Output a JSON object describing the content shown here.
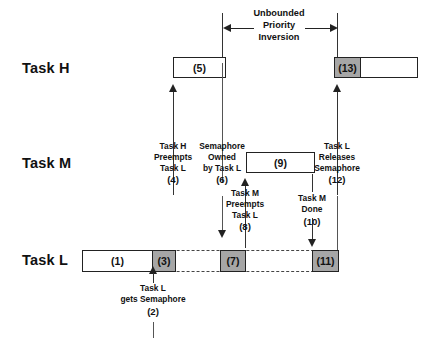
{
  "diagram": {
    "colors": {
      "busy_fill": "#a6a6a6",
      "idle_fill": "#ffffff",
      "stroke": "#222222"
    }
  },
  "span": {
    "line1": "Unbounded",
    "line2": "Priority",
    "line3": "Inversion"
  },
  "rows": [
    {
      "label": "Task H"
    },
    {
      "label": "Task M"
    },
    {
      "label": "Task L"
    }
  ],
  "segments": {
    "task_h_5": "(5)",
    "task_h_13_gray": "(13)",
    "task_m_9": "(9)",
    "task_l_1": "(1)",
    "task_l_3": "(3)",
    "task_l_7": "(7)",
    "task_l_11": "(11)"
  },
  "notes": [
    {
      "id": "n2",
      "lines": [
        "Task L",
        "gets Semaphore"
      ],
      "num": "(2)"
    },
    {
      "id": "n4",
      "lines": [
        "Task H",
        "Preempts",
        "Task L"
      ],
      "num": "(4)"
    },
    {
      "id": "n6",
      "lines": [
        "Semaphore",
        "Owned",
        "by Task L"
      ],
      "num": "(6)"
    },
    {
      "id": "n8",
      "lines": [
        "Task M",
        "Preempts",
        "Task L"
      ],
      "num": "(8)"
    },
    {
      "id": "n10",
      "lines": [
        "Task M",
        "Done"
      ],
      "num": "(10)"
    },
    {
      "id": "n12",
      "lines": [
        "Task L",
        "Releases",
        "Semaphore"
      ],
      "num": "(12)"
    }
  ]
}
